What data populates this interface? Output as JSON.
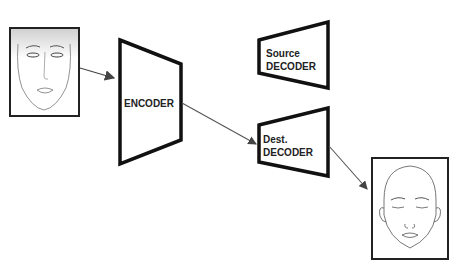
{
  "diagram": {
    "type": "autoencoder-face-swap",
    "nodes": {
      "source_face": {
        "label": "",
        "icon": "female-face-sketch"
      },
      "encoder": {
        "label": "ENCODER"
      },
      "source_decoder": {
        "line1": "Source",
        "line2": "DECODER"
      },
      "dest_decoder": {
        "line1": "Dest.",
        "line2": "DECODER"
      },
      "dest_face": {
        "label": "",
        "icon": "bald-face-sketch"
      }
    },
    "edges": [
      {
        "from": "source_face",
        "to": "encoder"
      },
      {
        "from": "encoder",
        "to": "dest_decoder"
      },
      {
        "from": "dest_decoder",
        "to": "dest_face"
      }
    ],
    "colors": {
      "box_stroke": "#111111",
      "arrow": "#555555",
      "sketch": "#444444"
    }
  }
}
